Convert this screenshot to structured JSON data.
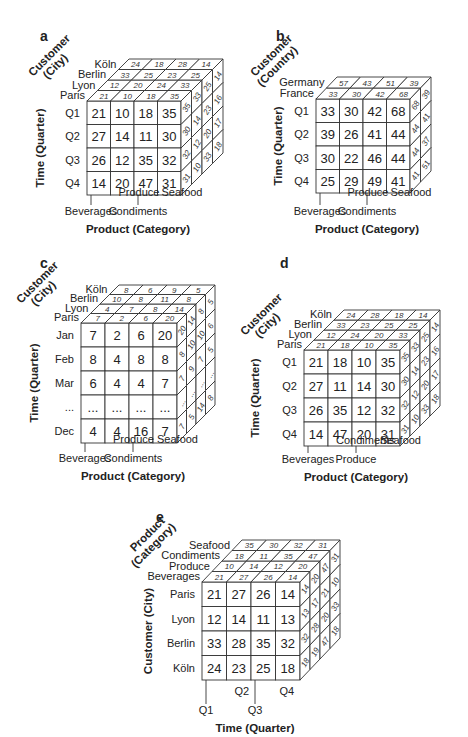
{
  "figure": {
    "panels": [
      {
        "letter": "a",
        "depth_axis_title": [
          "Customer",
          "(City)"
        ],
        "row_axis_title": "Time (Quarter)",
        "col_axis_title": "Product (Category)",
        "depth_labels": [
          "Paris",
          "Lyon",
          "Berlin",
          "Köln"
        ],
        "row_labels": [
          "Q1",
          "Q2",
          "Q3",
          "Q4"
        ],
        "col_labels": [
          "Beverages",
          "Produce",
          "Condiments",
          "Seafood"
        ],
        "front": [
          [
            21,
            10,
            18,
            35
          ],
          [
            27,
            14,
            11,
            30
          ],
          [
            26,
            12,
            35,
            32
          ],
          [
            14,
            20,
            47,
            31
          ]
        ],
        "top": [
          [
            21,
            10,
            18,
            35
          ],
          [
            12,
            20,
            24,
            33
          ],
          [
            33,
            25,
            23,
            25
          ],
          [
            24,
            18,
            28,
            14
          ]
        ],
        "side": [
          [
            35,
            33,
            25,
            14
          ],
          [
            30,
            14,
            23,
            16
          ],
          [
            32,
            12,
            20,
            17
          ],
          [
            31,
            10,
            33,
            18
          ]
        ]
      },
      {
        "letter": "b",
        "depth_axis_title": [
          "Customer",
          "(Country)"
        ],
        "row_axis_title": "Time (Quarter)",
        "col_axis_title": "Product (Category)",
        "depth_labels": [
          "France",
          "Germany"
        ],
        "row_labels": [
          "Q1",
          "Q2",
          "Q3",
          "Q4"
        ],
        "col_labels": [
          "Beverages",
          "Produce",
          "Condiments",
          "Seafood"
        ],
        "front": [
          [
            33,
            30,
            42,
            68
          ],
          [
            39,
            26,
            41,
            44
          ],
          [
            30,
            22,
            46,
            44
          ],
          [
            25,
            29,
            49,
            41
          ]
        ],
        "top": [
          [
            33,
            30,
            42,
            68
          ],
          [
            57,
            43,
            51,
            39
          ]
        ],
        "side": [
          [
            68,
            39
          ],
          [
            44,
            41
          ],
          [
            44,
            37
          ],
          [
            41,
            51
          ]
        ]
      },
      {
        "letter": "c",
        "depth_axis_title": [
          "Customer",
          "(City)"
        ],
        "row_axis_title": "Time (Quarter)",
        "col_axis_title": "Product (Category)",
        "depth_labels": [
          "Paris",
          "Lyon",
          "Berlin",
          "Köln"
        ],
        "row_labels": [
          "Jan",
          "Feb",
          "Mar",
          "...",
          "Dec"
        ],
        "col_labels": [
          "Beverages",
          "Produce",
          "Condiments",
          "Seafood"
        ],
        "front": [
          [
            "7",
            "2",
            "6",
            "20"
          ],
          [
            "8",
            "4",
            "8",
            "8"
          ],
          [
            "6",
            "4",
            "4",
            "7"
          ],
          [
            "...",
            "...",
            "...",
            "..."
          ],
          [
            "4",
            "4",
            "16",
            "7"
          ]
        ],
        "top": [
          [
            "7",
            "2",
            "6",
            "20"
          ],
          [
            "4",
            "7",
            "8",
            "14"
          ],
          [
            "10",
            "8",
            "11",
            "8"
          ],
          [
            "8",
            "6",
            "9",
            "5"
          ]
        ],
        "side": [
          [
            "20",
            "14",
            "8",
            "5"
          ],
          [
            "8",
            "10",
            "10",
            "6"
          ],
          [
            "7",
            "9",
            "7",
            "5"
          ],
          [
            "...",
            "...",
            "...",
            "..."
          ],
          [
            "7",
            "5",
            "14",
            "8"
          ]
        ]
      },
      {
        "letter": "d",
        "depth_axis_title": [
          "Customer",
          "(City)"
        ],
        "row_axis_title": "Time (Quarter)",
        "col_axis_title": "Product (Category)",
        "depth_labels": [
          "Paris",
          "Lyon",
          "Berlin",
          "Köln"
        ],
        "row_labels": [
          "Q1",
          "Q2",
          "Q3",
          "Q4"
        ],
        "col_labels": [
          "Beverages",
          "Condiments",
          "Produce",
          "Seafood"
        ],
        "front": [
          [
            21,
            18,
            10,
            35
          ],
          [
            27,
            11,
            14,
            30
          ],
          [
            26,
            35,
            12,
            32
          ],
          [
            14,
            47,
            20,
            31
          ]
        ],
        "top": [
          [
            21,
            18,
            10,
            35
          ],
          [
            12,
            24,
            20,
            33
          ],
          [
            33,
            23,
            25,
            25
          ],
          [
            24,
            28,
            18,
            14
          ]
        ],
        "side": [
          [
            35,
            33,
            25,
            14
          ],
          [
            30,
            14,
            23,
            16
          ],
          [
            32,
            12,
            20,
            17
          ],
          [
            31,
            10,
            33,
            18
          ]
        ]
      },
      {
        "letter": "e",
        "depth_axis_title": [
          "Product",
          "(Category)"
        ],
        "row_axis_title": "Customer (City)",
        "col_axis_title": "Time (Quarter)",
        "depth_labels": [
          "Beverages",
          "Produce",
          "Condiments",
          "Seafood"
        ],
        "row_labels": [
          "Paris",
          "Lyon",
          "Berlin",
          "Köln"
        ],
        "col_labels": [
          "Q1",
          "Q2",
          "Q3",
          "Q4"
        ],
        "front": [
          [
            21,
            27,
            26,
            14
          ],
          [
            12,
            14,
            11,
            13
          ],
          [
            33,
            28,
            35,
            32
          ],
          [
            24,
            23,
            25,
            18
          ]
        ],
        "top": [
          [
            21,
            27,
            26,
            14
          ],
          [
            10,
            14,
            12,
            20
          ],
          [
            18,
            11,
            35,
            47
          ],
          [
            35,
            30,
            32,
            31
          ]
        ],
        "side": [
          [
            14,
            20,
            47,
            31
          ],
          [
            13,
            17,
            21,
            10
          ],
          [
            32,
            28,
            20,
            33
          ],
          [
            18,
            19,
            47,
            18
          ]
        ]
      }
    ]
  }
}
